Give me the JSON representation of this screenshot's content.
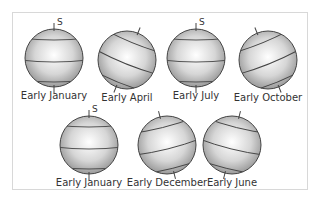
{
  "pole_label": "S",
  "row1": [
    {
      "label": "Early January",
      "cx": 54,
      "cy": 58,
      "tilt": 0,
      "pole": true
    },
    {
      "label": "Early April",
      "cx": 127,
      "cy": 60,
      "tilt": 22,
      "pole": false
    },
    {
      "label": "Early July",
      "cx": 196,
      "cy": 58,
      "tilt": 0,
      "pole": true
    },
    {
      "label": "Early October",
      "cx": 268,
      "cy": 60,
      "tilt": -22,
      "pole": false
    }
  ],
  "row2": [
    {
      "label": "Early January",
      "cx": 89,
      "cy": 145,
      "tilt": 0,
      "pole": true
    },
    {
      "label": "Early December",
      "cx": 167,
      "cy": 145,
      "tilt": -14,
      "pole": false
    },
    {
      "label": "Early June",
      "cx": 232,
      "cy": 145,
      "tilt": 14,
      "pole": false
    }
  ]
}
